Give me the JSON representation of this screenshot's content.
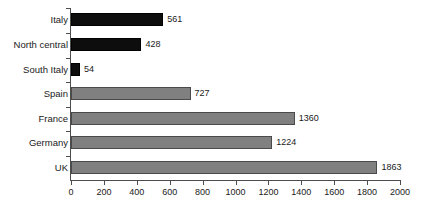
{
  "chart_data": {
    "type": "bar",
    "orientation": "horizontal",
    "title": "",
    "xlabel": "",
    "ylabel": "",
    "xlim": [
      0,
      2000
    ],
    "grid": false,
    "legend": "none",
    "xticks": [
      0,
      200,
      400,
      600,
      800,
      1000,
      1200,
      1400,
      1600,
      1800,
      2000
    ],
    "xtick_labels": [
      "0",
      "200",
      "400",
      "600",
      "800",
      "1000",
      "1200",
      "1400",
      "1600",
      "1800",
      "2000"
    ],
    "categories": [
      "Italy",
      "North central",
      "South Italy",
      "Spain",
      "France",
      "Germany",
      "UK"
    ],
    "values": [
      561,
      428,
      54,
      727,
      1360,
      1224,
      1863
    ],
    "value_labels": [
      "561",
      "428",
      "54",
      "727",
      "1360",
      "1224",
      "1863"
    ],
    "bar_colors": [
      "#0d0d0d",
      "#0d0d0d",
      "#0d0d0d",
      "#808080",
      "#808080",
      "#808080",
      "#808080"
    ],
    "series": [
      {
        "name": "Italy group",
        "color": "#0d0d0d",
        "points": [
          {
            "category": "Italy",
            "value": 561
          },
          {
            "category": "North central",
            "value": 428
          },
          {
            "category": "South Italy",
            "value": 54
          }
        ]
      },
      {
        "name": "Other countries",
        "color": "#808080",
        "points": [
          {
            "category": "Spain",
            "value": 727
          },
          {
            "category": "France",
            "value": 1360
          },
          {
            "category": "Germany",
            "value": 1224
          },
          {
            "category": "UK",
            "value": 1863
          }
        ]
      }
    ]
  },
  "colors": {
    "black_bar": "#0d0d0d",
    "gray_bar": "#808080",
    "axis": "#4d4d4d",
    "text": "#1a1a1a",
    "background": "#ffffff"
  }
}
